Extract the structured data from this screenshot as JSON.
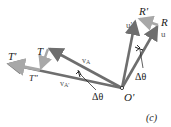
{
  "diagram": {
    "caption": "(c)",
    "origin_label": "O'",
    "colors": {
      "main_vector": "#6e6e6e",
      "change_vector": "#a8a8a8",
      "arc": "#1a1a1a",
      "leader": "#1a1a1a"
    },
    "left_group": {
      "point_T": "T",
      "point_T_prime": "T'",
      "point_T_dprime": "T\"",
      "vector_vA": "v",
      "vector_vA_sub": "A",
      "vector_vA_prime": "v",
      "vector_vA_prime_sub": "A'",
      "angle": "Δθ"
    },
    "right_group": {
      "point_R": "R",
      "point_R_prime": "R'",
      "unit_u": "u",
      "unit_u_prime": "u'",
      "angle": "Δθ"
    }
  }
}
